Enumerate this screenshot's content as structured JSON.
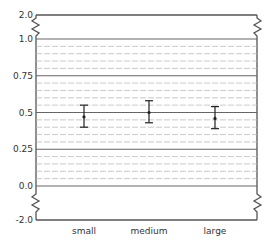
{
  "chart_data": {
    "type": "errorbar",
    "title": "",
    "xlabel": "",
    "ylabel": "",
    "categories": [
      "small",
      "medium",
      "large"
    ],
    "values": [
      0.47,
      0.5,
      0.46
    ],
    "error_low": [
      0.4,
      0.43,
      0.39
    ],
    "error_high": [
      0.55,
      0.58,
      0.54
    ],
    "y_ticks": [
      "2.0",
      "1.0",
      "0.75",
      "0.5",
      "0.25",
      "0.0",
      "-2.0"
    ],
    "axis_breaks": [
      "between 1.0 and 2.0",
      "between 0.0 and -2.0"
    ],
    "ylim": [
      -2.0,
      2.0
    ],
    "grid": {
      "major_step": 0.25,
      "minor_step": 0.05,
      "minor_style": "dashed"
    },
    "legend": null
  },
  "colors": {
    "frame": "#555555",
    "grid_major": "#666666",
    "grid_minor": "#bbbbbb",
    "marker": "#222222"
  }
}
